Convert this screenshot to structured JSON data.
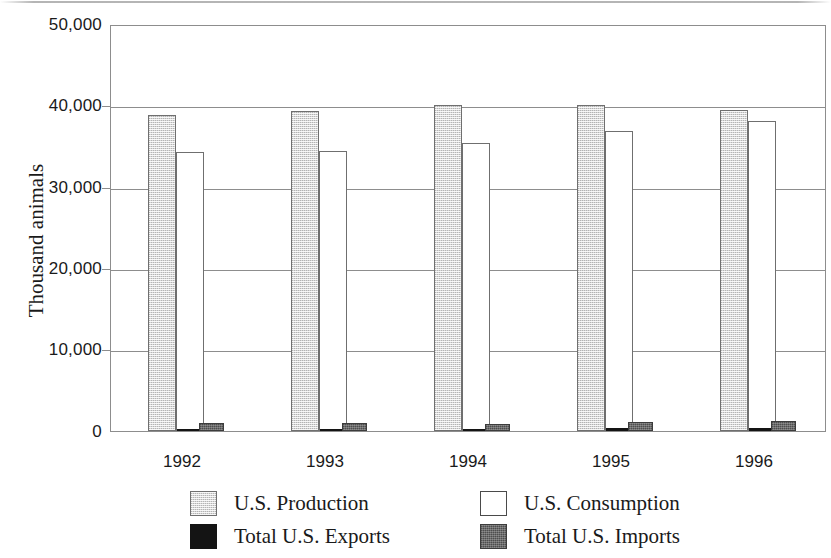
{
  "chart_data": {
    "type": "bar",
    "title": "",
    "subtitle": "",
    "xlabel": "",
    "ylabel": "Thousand animals",
    "categories": [
      "1992",
      "1993",
      "1994",
      "1995",
      "1996"
    ],
    "ylim": [
      0,
      50000
    ],
    "ytick_labels": [
      "0",
      "10,000",
      "20,000",
      "30,000",
      "40,000",
      "50,000"
    ],
    "ytick_values": [
      0,
      10000,
      20000,
      30000,
      40000,
      50000
    ],
    "grid": "horizontal",
    "legend_position": "bottom",
    "series": [
      {
        "name": "U.S. Production",
        "color": "#d8d8d8",
        "values": [
          38900,
          39400,
          40100,
          40200,
          39500
        ]
      },
      {
        "name": "U.S. Consumption",
        "color": "#ffffff",
        "values": [
          34300,
          34500,
          35500,
          37000,
          38200
        ]
      },
      {
        "name": "Total U.S. Exports",
        "color": "#141414",
        "values": [
          300,
          200,
          250,
          350,
          400
        ]
      },
      {
        "name": "Total U.S. Imports",
        "color": "#6b6b6b",
        "values": [
          1000,
          950,
          900,
          1100,
          1250
        ]
      }
    ]
  },
  "legend": {
    "items": [
      {
        "label": "U.S. Production",
        "swatch": "production"
      },
      {
        "label": "U.S. Consumption",
        "swatch": "consumption"
      },
      {
        "label": "Total U.S. Exports",
        "swatch": "exports"
      },
      {
        "label": "Total U.S. Imports",
        "swatch": "imports"
      }
    ]
  },
  "axis": {
    "y_title": "Thousand animals"
  }
}
